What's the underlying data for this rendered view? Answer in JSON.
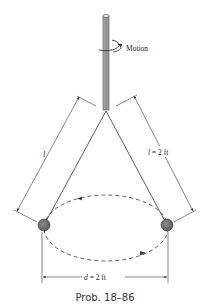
{
  "figure": {
    "caption": "Prob. 18–86",
    "motion_label": "Motion",
    "length_label_left": "l",
    "length_label_right": "l = 2 ft",
    "distance_label": "d = 2 ft"
  },
  "colors": {
    "line": "#333333",
    "rod_fill": "#9a9a9a",
    "ball_fill": "#707070",
    "background": "#ffffff"
  }
}
